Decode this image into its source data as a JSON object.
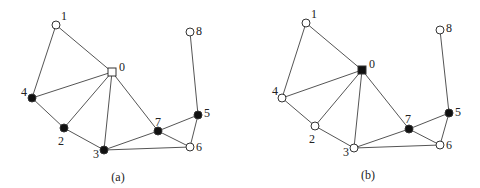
{
  "graphs": [
    {
      "id": "a",
      "caption": "(a)",
      "caption_pos": [
        118,
        181
      ],
      "nodes": [
        {
          "id": "0",
          "x": 112,
          "y": 72,
          "shape": "square",
          "fill": "white",
          "lx": 119,
          "ly": 71
        },
        {
          "id": "1",
          "x": 56,
          "y": 25,
          "shape": "circle",
          "fill": "white",
          "lx": 61,
          "ly": 20
        },
        {
          "id": "2",
          "x": 64,
          "y": 128,
          "shape": "circle",
          "fill": "black",
          "lx": 58,
          "ly": 145
        },
        {
          "id": "3",
          "x": 104,
          "y": 150,
          "shape": "circle",
          "fill": "black",
          "lx": 93,
          "ly": 158
        },
        {
          "id": "4",
          "x": 32,
          "y": 98,
          "shape": "circle",
          "fill": "black",
          "lx": 21,
          "ly": 96
        },
        {
          "id": "5",
          "x": 198,
          "y": 115,
          "shape": "circle",
          "fill": "black",
          "lx": 204,
          "ly": 117
        },
        {
          "id": "6",
          "x": 190,
          "y": 147,
          "shape": "circle",
          "fill": "white",
          "lx": 196,
          "ly": 151
        },
        {
          "id": "7",
          "x": 158,
          "y": 131,
          "shape": "circle",
          "fill": "black",
          "lx": 155,
          "ly": 126
        },
        {
          "id": "8",
          "x": 190,
          "y": 32,
          "shape": "circle",
          "fill": "white",
          "lx": 196,
          "ly": 35
        }
      ],
      "edges": [
        [
          "1",
          "4"
        ],
        [
          "1",
          "0"
        ],
        [
          "0",
          "4"
        ],
        [
          "0",
          "2"
        ],
        [
          "0",
          "3"
        ],
        [
          "0",
          "7"
        ],
        [
          "4",
          "2"
        ],
        [
          "2",
          "3"
        ],
        [
          "3",
          "7"
        ],
        [
          "3",
          "6"
        ],
        [
          "7",
          "6"
        ],
        [
          "7",
          "5"
        ],
        [
          "5",
          "6"
        ],
        [
          "5",
          "8"
        ]
      ]
    },
    {
      "id": "b",
      "caption": "(b)",
      "caption_pos": [
        368,
        179
      ],
      "nodes": [
        {
          "id": "0",
          "x": 362,
          "y": 70,
          "shape": "square",
          "fill": "black",
          "lx": 369,
          "ly": 68
        },
        {
          "id": "1",
          "x": 306,
          "y": 23,
          "shape": "circle",
          "fill": "white",
          "lx": 311,
          "ly": 18
        },
        {
          "id": "2",
          "x": 315,
          "y": 126,
          "shape": "circle",
          "fill": "white",
          "lx": 309,
          "ly": 143
        },
        {
          "id": "3",
          "x": 354,
          "y": 148,
          "shape": "circle",
          "fill": "white",
          "lx": 343,
          "ly": 156
        },
        {
          "id": "4",
          "x": 282,
          "y": 98,
          "shape": "circle",
          "fill": "white",
          "lx": 272,
          "ly": 95
        },
        {
          "id": "5",
          "x": 449,
          "y": 113,
          "shape": "circle",
          "fill": "black",
          "lx": 455,
          "ly": 116
        },
        {
          "id": "6",
          "x": 440,
          "y": 145,
          "shape": "circle",
          "fill": "white",
          "lx": 446,
          "ly": 149
        },
        {
          "id": "7",
          "x": 409,
          "y": 129,
          "shape": "circle",
          "fill": "black",
          "lx": 405,
          "ly": 123
        },
        {
          "id": "8",
          "x": 440,
          "y": 30,
          "shape": "circle",
          "fill": "white",
          "lx": 446,
          "ly": 32
        }
      ],
      "edges": [
        [
          "1",
          "4"
        ],
        [
          "1",
          "0"
        ],
        [
          "0",
          "4"
        ],
        [
          "0",
          "2"
        ],
        [
          "0",
          "3"
        ],
        [
          "0",
          "7"
        ],
        [
          "4",
          "2"
        ],
        [
          "2",
          "3"
        ],
        [
          "3",
          "7"
        ],
        [
          "3",
          "6"
        ],
        [
          "7",
          "6"
        ],
        [
          "7",
          "5"
        ],
        [
          "5",
          "6"
        ],
        [
          "5",
          "8"
        ]
      ]
    }
  ]
}
